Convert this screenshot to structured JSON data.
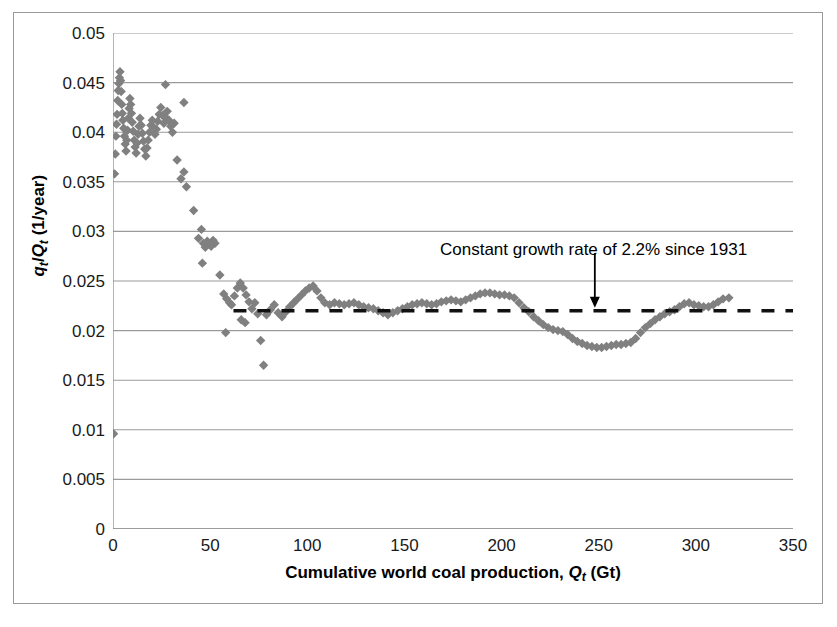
{
  "figure": {
    "width": 837,
    "height": 627,
    "background": "#ffffff",
    "frame_color": "#999999"
  },
  "chart_data": {
    "type": "scatter",
    "title": "",
    "xlabel_parts": {
      "prefix": "Cumulative world coal production, ",
      "symbol": "Q",
      "subscript": "t",
      "suffix": " (Gt)"
    },
    "xlabel": "Cumulative world coal production, Qt (Gt)",
    "ylabel_parts": {
      "symbol1": "q",
      "subscript1": "t",
      "separator": "/",
      "symbol2": "Q",
      "subscript2": "t",
      "suffix": " (1/year)"
    },
    "ylabel": "qt/Qt (1/year)",
    "xlim": [
      0,
      350
    ],
    "ylim": [
      0,
      0.05
    ],
    "xticks": [
      0,
      50,
      100,
      150,
      200,
      250,
      300,
      350
    ],
    "xtick_labels": [
      "0",
      "50",
      "100",
      "150",
      "200",
      "250",
      "300",
      "350"
    ],
    "yticks": [
      0,
      0.005,
      0.01,
      0.015,
      0.02,
      0.025,
      0.03,
      0.035,
      0.04,
      0.045,
      0.05
    ],
    "ytick_labels": [
      "0",
      "0.005",
      "0.01",
      "0.015",
      "0.02",
      "0.025",
      "0.03",
      "0.035",
      "0.04",
      "0.045",
      "0.05"
    ],
    "grid": {
      "horizontal": true,
      "vertical": false,
      "color": "#9a9a9a"
    },
    "legend": null,
    "marker": {
      "shape": "diamond",
      "color": "#808080",
      "size": 7
    },
    "annotations": [
      {
        "text": "Constant growth rate of 2.2% since 1931",
        "x": 175,
        "y": 0.0278,
        "arrow_to_x": 248,
        "arrow_to_y": 0.0223
      }
    ],
    "reference_line": {
      "label": "Constant growth rate of 2.2% since 1931",
      "style": "dashed",
      "color": "#000000",
      "y": 0.022,
      "x_start": 62,
      "x_end": 350
    },
    "points": [
      [
        0.3,
        0.0096
      ],
      [
        0.8,
        0.0358
      ],
      [
        1.2,
        0.0378
      ],
      [
        1.5,
        0.0396
      ],
      [
        1.8,
        0.0408
      ],
      [
        2.1,
        0.0418
      ],
      [
        2.4,
        0.0432
      ],
      [
        2.7,
        0.0442
      ],
      [
        3.0,
        0.0449
      ],
      [
        3.3,
        0.0455
      ],
      [
        3.6,
        0.0461
      ],
      [
        3.9,
        0.0452
      ],
      [
        4.2,
        0.0441
      ],
      [
        4.5,
        0.0428
      ],
      [
        4.8,
        0.0419
      ],
      [
        5.1,
        0.0412
      ],
      [
        5.5,
        0.0404
      ],
      [
        5.9,
        0.0396
      ],
      [
        6.3,
        0.0388
      ],
      [
        6.7,
        0.0381
      ],
      [
        7.1,
        0.0392
      ],
      [
        7.5,
        0.0402
      ],
      [
        7.9,
        0.0414
      ],
      [
        8.3,
        0.0424
      ],
      [
        8.7,
        0.0434
      ],
      [
        9.1,
        0.0428
      ],
      [
        9.5,
        0.0419
      ],
      [
        9.9,
        0.041
      ],
      [
        10.4,
        0.0401
      ],
      [
        10.9,
        0.0392
      ],
      [
        11.4,
        0.0385
      ],
      [
        11.9,
        0.0379
      ],
      [
        12.4,
        0.0389
      ],
      [
        12.9,
        0.0398
      ],
      [
        13.4,
        0.0406
      ],
      [
        13.9,
        0.0414
      ],
      [
        14.5,
        0.0407
      ],
      [
        15.1,
        0.0399
      ],
      [
        15.7,
        0.0391
      ],
      [
        16.3,
        0.0383
      ],
      [
        16.9,
        0.0376
      ],
      [
        17.5,
        0.0384
      ],
      [
        18.1,
        0.0392
      ],
      [
        18.8,
        0.04
      ],
      [
        19.5,
        0.0407
      ],
      [
        20.2,
        0.0412
      ],
      [
        20.9,
        0.0405
      ],
      [
        21.6,
        0.0398
      ],
      [
        22.3,
        0.0403
      ],
      [
        23.0,
        0.0411
      ],
      [
        23.8,
        0.0418
      ],
      [
        24.6,
        0.0425
      ],
      [
        25.4,
        0.0417
      ],
      [
        26.2,
        0.0409
      ],
      [
        27.0,
        0.0415
      ],
      [
        27.9,
        0.0421
      ],
      [
        28.8,
        0.0412
      ],
      [
        29.7,
        0.0406
      ],
      [
        30.6,
        0.04
      ],
      [
        31.5,
        0.0409
      ],
      [
        27.0,
        0.0448
      ],
      [
        36.5,
        0.043
      ],
      [
        33.0,
        0.0372
      ],
      [
        35.0,
        0.0353
      ],
      [
        36.5,
        0.036
      ],
      [
        37.8,
        0.0345
      ],
      [
        41.5,
        0.0321
      ],
      [
        44.0,
        0.0293
      ],
      [
        45.5,
        0.0302
      ],
      [
        46.5,
        0.0288
      ],
      [
        47.5,
        0.0284
      ],
      [
        48.5,
        0.029
      ],
      [
        49.5,
        0.0287
      ],
      [
        50.5,
        0.0285
      ],
      [
        51.5,
        0.0291
      ],
      [
        52.5,
        0.0288
      ],
      [
        46.0,
        0.0268
      ],
      [
        55.0,
        0.0256
      ],
      [
        57.0,
        0.0237
      ],
      [
        58.5,
        0.0232
      ],
      [
        60.0,
        0.0228
      ],
      [
        61.0,
        0.0226
      ],
      [
        58.0,
        0.0198
      ],
      [
        62.5,
        0.0235
      ],
      [
        64.0,
        0.0243
      ],
      [
        65.5,
        0.0248
      ],
      [
        67.0,
        0.0243
      ],
      [
        68.5,
        0.0236
      ],
      [
        70.0,
        0.0229
      ],
      [
        66.0,
        0.0211
      ],
      [
        68.0,
        0.0208
      ],
      [
        71.5,
        0.0222
      ],
      [
        73.0,
        0.0228
      ],
      [
        74.5,
        0.0217
      ],
      [
        76.0,
        0.019
      ],
      [
        77.5,
        0.0165
      ],
      [
        79.0,
        0.0216
      ],
      [
        81.0,
        0.0221
      ],
      [
        83.0,
        0.0226
      ],
      [
        85.0,
        0.0218
      ],
      [
        87.0,
        0.0214
      ],
      [
        89.0,
        0.0219
      ],
      [
        91.0,
        0.0224
      ],
      [
        93.0,
        0.0228
      ],
      [
        95.0,
        0.0232
      ],
      [
        97.0,
        0.0236
      ],
      [
        99.0,
        0.024
      ],
      [
        101.0,
        0.0243
      ],
      [
        103.0,
        0.0245
      ],
      [
        105.0,
        0.024
      ],
      [
        107.0,
        0.0233
      ],
      [
        109.0,
        0.0228
      ],
      [
        111.5,
        0.0226
      ],
      [
        114.0,
        0.0228
      ],
      [
        116.5,
        0.0227
      ],
      [
        119.0,
        0.0226
      ],
      [
        121.5,
        0.0227
      ],
      [
        124.0,
        0.0228
      ],
      [
        126.5,
        0.0226
      ],
      [
        129.0,
        0.0224
      ],
      [
        131.5,
        0.0223
      ],
      [
        134.0,
        0.0222
      ],
      [
        136.5,
        0.022
      ],
      [
        139.0,
        0.0218
      ],
      [
        141.5,
        0.0216
      ],
      [
        144.0,
        0.0218
      ],
      [
        146.5,
        0.022
      ],
      [
        149.0,
        0.0222
      ],
      [
        151.5,
        0.0224
      ],
      [
        154.0,
        0.0226
      ],
      [
        156.5,
        0.0227
      ],
      [
        159.0,
        0.0228
      ],
      [
        161.5,
        0.0227
      ],
      [
        164.0,
        0.0226
      ],
      [
        166.5,
        0.0227
      ],
      [
        169.0,
        0.0229
      ],
      [
        171.5,
        0.023
      ],
      [
        174.0,
        0.0231
      ],
      [
        176.5,
        0.023
      ],
      [
        179.0,
        0.0229
      ],
      [
        181.5,
        0.0231
      ],
      [
        184.0,
        0.0233
      ],
      [
        186.5,
        0.0235
      ],
      [
        189.0,
        0.0237
      ],
      [
        191.5,
        0.0238
      ],
      [
        194.0,
        0.0238
      ],
      [
        196.5,
        0.0237
      ],
      [
        199.0,
        0.0236
      ],
      [
        201.5,
        0.0236
      ],
      [
        204.0,
        0.0235
      ],
      [
        206.5,
        0.0233
      ],
      [
        209.0,
        0.0228
      ],
      [
        211.5,
        0.0223
      ],
      [
        214.0,
        0.0219
      ],
      [
        216.5,
        0.0214
      ],
      [
        219.0,
        0.021
      ],
      [
        221.5,
        0.0206
      ],
      [
        224.0,
        0.0203
      ],
      [
        226.5,
        0.0201
      ],
      [
        229.0,
        0.02
      ],
      [
        231.5,
        0.0199
      ],
      [
        234.0,
        0.0196
      ],
      [
        236.5,
        0.0192
      ],
      [
        239.0,
        0.0189
      ],
      [
        241.5,
        0.0187
      ],
      [
        244.0,
        0.0185
      ],
      [
        246.5,
        0.0184
      ],
      [
        249.0,
        0.0183
      ],
      [
        251.5,
        0.0183
      ],
      [
        254.0,
        0.0184
      ],
      [
        256.5,
        0.0185
      ],
      [
        259.0,
        0.0186
      ],
      [
        261.5,
        0.0186
      ],
      [
        264.0,
        0.0187
      ],
      [
        266.5,
        0.0188
      ],
      [
        269.0,
        0.0192
      ],
      [
        271.5,
        0.0198
      ],
      [
        274.0,
        0.0203
      ],
      [
        276.5,
        0.0207
      ],
      [
        279.0,
        0.0211
      ],
      [
        281.5,
        0.0214
      ],
      [
        284.0,
        0.0217
      ],
      [
        286.5,
        0.0219
      ],
      [
        289.0,
        0.0221
      ],
      [
        291.5,
        0.0224
      ],
      [
        294.0,
        0.0227
      ],
      [
        296.5,
        0.0228
      ],
      [
        299.0,
        0.0226
      ],
      [
        301.5,
        0.0225
      ],
      [
        304.0,
        0.0224
      ],
      [
        306.5,
        0.0224
      ],
      [
        309.0,
        0.0226
      ],
      [
        311.5,
        0.0229
      ],
      [
        314.0,
        0.0232
      ],
      [
        317.0,
        0.0233
      ]
    ]
  }
}
